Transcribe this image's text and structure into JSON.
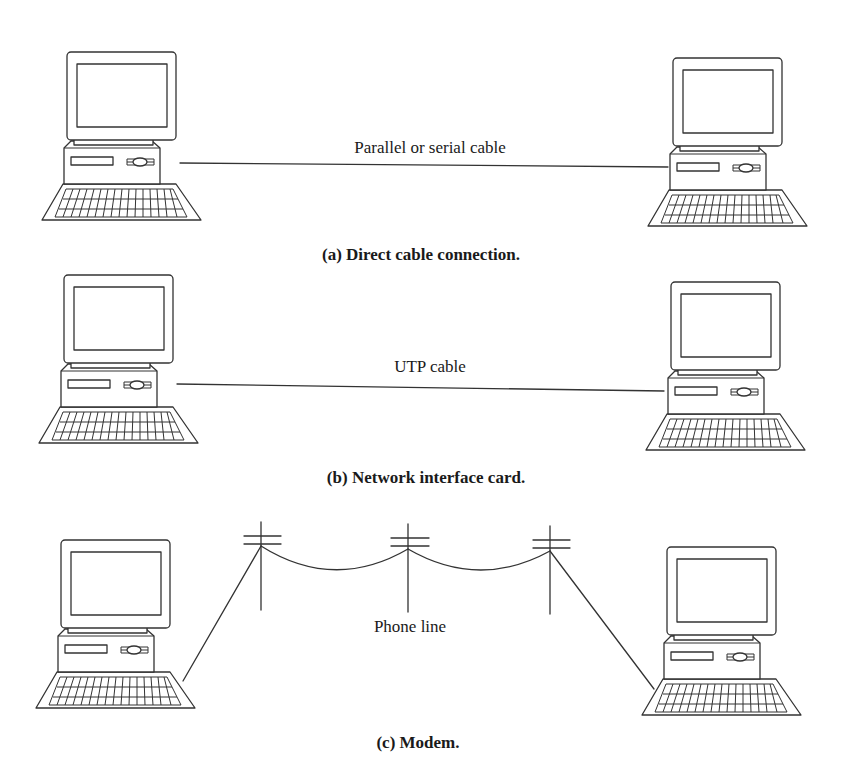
{
  "diagram": {
    "panels": [
      {
        "id": "a",
        "caption": "(a) Direct cable connection.",
        "link_label": "Parallel or serial cable",
        "link_type": "straight-cable",
        "left_computer": "computer-icon",
        "right_computer": "computer-icon"
      },
      {
        "id": "b",
        "caption": "(b) Network interface card.",
        "link_label": "UTP cable",
        "link_type": "straight-cable",
        "left_computer": "computer-icon",
        "right_computer": "computer-icon"
      },
      {
        "id": "c",
        "caption": "(c) Modem.",
        "link_label": "Phone line",
        "link_type": "telephone-poles",
        "pole_count": 3,
        "left_computer": "computer-icon",
        "right_computer": "computer-icon"
      }
    ],
    "colors": {
      "line": "#333333",
      "text": "#1a1a1a",
      "background": "#ffffff"
    }
  }
}
